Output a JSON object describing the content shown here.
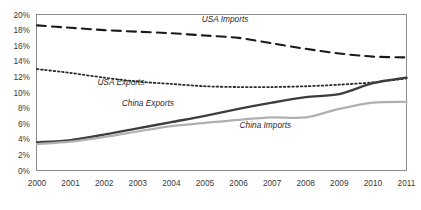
{
  "chart_data": {
    "type": "line",
    "title": "",
    "subtitle": "",
    "xlabel": "",
    "ylabel": "",
    "x": [
      2000,
      2001,
      2002,
      2003,
      2004,
      2005,
      2006,
      2007,
      2008,
      2009,
      2010,
      2011
    ],
    "categories": [
      "2000",
      "2001",
      "2002",
      "2003",
      "2004",
      "2005",
      "2006",
      "2007",
      "2008",
      "2009",
      "2010",
      "2011"
    ],
    "xlim": [
      2000,
      2011
    ],
    "ylim": [
      0,
      20
    ],
    "ytick_values": [
      0,
      2,
      4,
      6,
      8,
      10,
      12,
      14,
      16,
      18,
      20
    ],
    "ytick_labels": [
      "0%",
      "2%",
      "4%",
      "6%",
      "8%",
      "10%",
      "12%",
      "14%",
      "16%",
      "18%",
      "20%"
    ],
    "grid": false,
    "legend_position": "inline-annotations",
    "value_unit": "percent",
    "series": [
      {
        "name": "USA Imports",
        "style": "dashed",
        "color": "#1a1a1a",
        "width": 2.1,
        "label_x": 2005.6,
        "label_y": 19.0,
        "values": [
          18.6,
          18.3,
          18.0,
          17.8,
          17.6,
          17.3,
          17.0,
          16.3,
          15.6,
          15.0,
          14.6,
          14.5
        ]
      },
      {
        "name": "USA Exports",
        "style": "dotted",
        "color": "#2b2b2b",
        "width": 1.8,
        "label_x": 2002.5,
        "label_y": 10.9,
        "values": [
          13.0,
          12.5,
          11.9,
          11.4,
          11.1,
          10.8,
          10.7,
          10.7,
          10.8,
          11.0,
          11.3,
          11.8
        ]
      },
      {
        "name": "China Exports",
        "style": "solid",
        "color": "#3d3d3d",
        "width": 2.4,
        "label_x": 2003.3,
        "label_y": 8.3,
        "values": [
          3.6,
          3.9,
          4.6,
          5.4,
          6.2,
          7.0,
          7.9,
          8.7,
          9.4,
          9.8,
          11.2,
          11.9
        ]
      },
      {
        "name": "China Imports",
        "style": "solid",
        "color": "#b0b0b0",
        "width": 2.2,
        "label_x": 2006.8,
        "label_y": 5.5,
        "values": [
          3.4,
          3.7,
          4.3,
          5.0,
          5.7,
          6.1,
          6.5,
          6.8,
          6.8,
          7.9,
          8.7,
          8.8
        ]
      }
    ]
  }
}
